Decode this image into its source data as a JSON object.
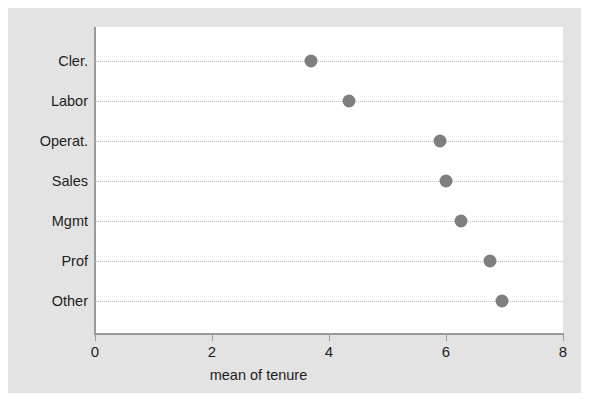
{
  "chart_data": {
    "type": "scatter",
    "orientation": "horizontal",
    "title": "",
    "subtitle": "",
    "xlabel": "mean of tenure",
    "ylabel": "",
    "xlim": [
      0,
      8
    ],
    "xticks": [
      0,
      2,
      4,
      6,
      8
    ],
    "xtick_labels": [
      "0",
      "2",
      "4",
      "6",
      "8"
    ],
    "categories": [
      "Cler.",
      "Labor",
      "Operat.",
      "Sales",
      "Mgmt",
      "Prof",
      "Other"
    ],
    "values": [
      3.7,
      4.35,
      5.9,
      6.0,
      6.25,
      6.75,
      6.95
    ],
    "points": [
      {
        "category": "Cler.",
        "value": 3.7
      },
      {
        "category": "Labor",
        "value": 4.35
      },
      {
        "category": "Operat.",
        "value": 5.9
      },
      {
        "category": "Sales",
        "value": 6.0
      },
      {
        "category": "Mgmt",
        "value": 6.25
      },
      {
        "category": "Prof",
        "value": 6.75
      },
      {
        "category": "Other",
        "value": 6.95
      }
    ],
    "grid": "horizontal-dotted",
    "legend": null,
    "marker": "filled-circle",
    "marker_color": "#7f7f7f",
    "plot_background": "#ffffff",
    "figure_background": "#e3e3e3",
    "axis_color": "#9a9a9a",
    "gridline_color": "#bdbdbd",
    "text_color": "#1d1d1d"
  }
}
